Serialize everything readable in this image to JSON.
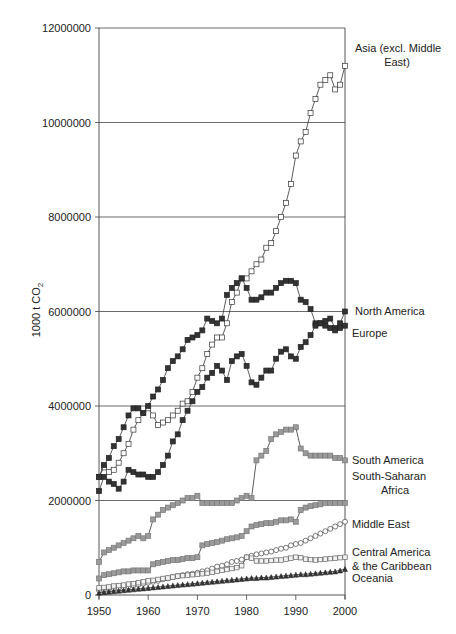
{
  "chart_data": {
    "type": "line",
    "title": "",
    "xlabel": "",
    "ylabel": "1000 t CO2",
    "ylabel_display": {
      "main": "1000 t CO",
      "sub": "2"
    },
    "xlim": [
      1950,
      2000
    ],
    "ylim": [
      0,
      12000000
    ],
    "x_ticks": [
      1950,
      1960,
      1970,
      1980,
      1990,
      2000
    ],
    "y_ticks": [
      0,
      2000000,
      4000000,
      6000000,
      8000000,
      10000000,
      12000000
    ],
    "y_tick_labels": [
      "0",
      "2000000",
      "4000000",
      "6000000",
      "8000000",
      "10000000",
      "12000000"
    ],
    "grid": "horizontal",
    "legend": "direct labels at right end of series",
    "x": [
      1950,
      1951,
      1952,
      1953,
      1954,
      1955,
      1956,
      1957,
      1958,
      1959,
      1960,
      1961,
      1962,
      1963,
      1964,
      1965,
      1966,
      1967,
      1968,
      1969,
      1970,
      1971,
      1972,
      1973,
      1974,
      1975,
      1976,
      1977,
      1978,
      1979,
      1980,
      1981,
      1982,
      1983,
      1984,
      1985,
      1986,
      1987,
      1988,
      1989,
      1990,
      1991,
      1992,
      1993,
      1994,
      1995,
      1996,
      1997,
      1998,
      1999,
      2000
    ],
    "series": [
      {
        "name": "Asia (excl. Middle East)",
        "label_lines": [
          "Asia (excl. Middle",
          "East)"
        ],
        "marker": "open-square",
        "values": [
          2500000,
          2700000,
          2600000,
          2650000,
          2800000,
          3000000,
          3200000,
          3500000,
          3700000,
          3850000,
          3950000,
          3800000,
          3600000,
          3650000,
          3700000,
          3800000,
          3900000,
          4050000,
          4100000,
          4300000,
          4600000,
          4800000,
          5100000,
          5300000,
          5450000,
          5450000,
          5750000,
          6200000,
          6400000,
          6700000,
          6700000,
          6850000,
          7000000,
          7100000,
          7350000,
          7450000,
          7700000,
          8000000,
          8300000,
          8700000,
          9300000,
          9600000,
          9800000,
          10200000,
          10500000,
          10800000,
          10900000,
          11000000,
          10700000,
          10800000,
          11200000
        ]
      },
      {
        "name": "North America",
        "label_lines": [
          "North America"
        ],
        "marker": "filled-square",
        "values": [
          2500000,
          2750000,
          2900000,
          3150000,
          3300000,
          3550000,
          3800000,
          3950000,
          3950000,
          3850000,
          4000000,
          4200000,
          4350000,
          4550000,
          4800000,
          4950000,
          5050000,
          5200000,
          5400000,
          5450000,
          5500000,
          5600000,
          5850000,
          5800000,
          5750000,
          5850000,
          6350000,
          6500000,
          6600000,
          6700000,
          6500000,
          6250000,
          6250000,
          6300000,
          6400000,
          6400000,
          6500000,
          6600000,
          6650000,
          6650000,
          6600000,
          6250000,
          6200000,
          6050000,
          5750000,
          5750000,
          5700000,
          5850000,
          5650000,
          5750000,
          6000000
        ]
      },
      {
        "name": "Europe",
        "label_lines": [
          "Europe"
        ],
        "marker": "filled-square",
        "values": [
          2200000,
          2500000,
          2400000,
          2350000,
          2250000,
          2400000,
          2650000,
          2600000,
          2550000,
          2550000,
          2500000,
          2500000,
          2600000,
          2750000,
          2950000,
          3250000,
          3400000,
          3700000,
          3900000,
          4100000,
          4300000,
          4400000,
          4600000,
          4700000,
          4850000,
          4750000,
          4550000,
          4950000,
          5050000,
          5100000,
          4850000,
          4500000,
          4450000,
          4600000,
          4750000,
          4750000,
          5000000,
          5150000,
          5200000,
          5050000,
          5000000,
          5250000,
          5350000,
          5500000,
          5700000,
          5750000,
          5800000,
          5650000,
          5600000,
          5650000,
          5700000
        ]
      },
      {
        "name": "South America",
        "label_lines": [
          "South America"
        ],
        "marker": "gray-square",
        "values": [
          700000,
          900000,
          950000,
          1000000,
          1050000,
          1100000,
          1150000,
          1200000,
          1250000,
          1200000,
          1250000,
          1600000,
          1700000,
          1800000,
          1850000,
          1900000,
          1950000,
          2000000,
          2050000,
          2050000,
          2100000,
          1950000,
          1950000,
          1950000,
          1950000,
          1950000,
          1950000,
          1950000,
          2000000,
          2050000,
          2100000,
          2050000,
          2850000,
          2950000,
          3050000,
          3300000,
          3400000,
          3450000,
          3500000,
          3500000,
          3550000,
          3100000,
          3000000,
          2950000,
          2950000,
          2950000,
          2950000,
          2950000,
          2900000,
          2900000,
          2850000
        ]
      },
      {
        "name": "South-Saharan Africa",
        "label_lines": [
          "South-Saharan",
          "Africa"
        ],
        "marker": "gray-square",
        "values": [
          350000,
          420000,
          440000,
          460000,
          480000,
          500000,
          500000,
          520000,
          520000,
          520000,
          520000,
          650000,
          680000,
          700000,
          720000,
          740000,
          740000,
          760000,
          780000,
          780000,
          800000,
          1050000,
          1080000,
          1100000,
          1120000,
          1150000,
          1180000,
          1200000,
          1220000,
          1250000,
          1350000,
          1450000,
          1480000,
          1500000,
          1520000,
          1520000,
          1550000,
          1580000,
          1580000,
          1600000,
          1550000,
          1800000,
          1850000,
          1880000,
          1900000,
          1920000,
          1950000,
          1950000,
          1950000,
          1950000,
          1950000
        ]
      },
      {
        "name": "Middle East",
        "label_lines": [
          "Middle East"
        ],
        "marker": "open-circle",
        "values": [
          100000,
          120000,
          130000,
          140000,
          150000,
          160000,
          180000,
          200000,
          220000,
          240000,
          260000,
          280000,
          300000,
          330000,
          350000,
          380000,
          400000,
          420000,
          440000,
          450000,
          470000,
          500000,
          520000,
          560000,
          600000,
          620000,
          650000,
          700000,
          720000,
          750000,
          800000,
          830000,
          860000,
          880000,
          900000,
          920000,
          950000,
          980000,
          1000000,
          1050000,
          1080000,
          1100000,
          1150000,
          1200000,
          1250000,
          1300000,
          1350000,
          1400000,
          1450000,
          1500000,
          1550000
        ]
      },
      {
        "name": "Central America & the Caribbean",
        "label_lines": [
          "Central America",
          "& the Caribbean"
        ],
        "marker": "open-square-light",
        "values": [
          150000,
          160000,
          170000,
          190000,
          200000,
          210000,
          230000,
          240000,
          260000,
          280000,
          300000,
          310000,
          330000,
          350000,
          360000,
          380000,
          400000,
          410000,
          420000,
          430000,
          440000,
          450000,
          460000,
          480000,
          500000,
          520000,
          540000,
          560000,
          580000,
          620000,
          800000,
          780000,
          720000,
          720000,
          720000,
          730000,
          740000,
          740000,
          760000,
          780000,
          800000,
          790000,
          760000,
          750000,
          740000,
          750000,
          760000,
          770000,
          780000,
          790000,
          800000
        ]
      },
      {
        "name": "Oceania",
        "label_lines": [
          "Oceania"
        ],
        "marker": "filled-triangle",
        "values": [
          50000,
          60000,
          70000,
          80000,
          90000,
          100000,
          110000,
          120000,
          130000,
          140000,
          150000,
          160000,
          170000,
          180000,
          190000,
          200000,
          210000,
          220000,
          230000,
          240000,
          250000,
          260000,
          270000,
          280000,
          290000,
          300000,
          310000,
          320000,
          330000,
          340000,
          350000,
          360000,
          360000,
          370000,
          370000,
          380000,
          390000,
          400000,
          410000,
          420000,
          430000,
          440000,
          440000,
          450000,
          460000,
          470000,
          480000,
          490000,
          500000,
          520000,
          550000
        ]
      }
    ]
  }
}
